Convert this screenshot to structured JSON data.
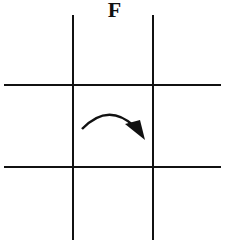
{
  "diagram": {
    "title": "F",
    "grid": {
      "vertical_lines_x": [
        73,
        153
      ],
      "horizontal_lines_y": [
        85,
        167
      ],
      "line_color": "#111111"
    },
    "arrow": {
      "direction": "clockwise-curved",
      "color": "#111111"
    }
  }
}
